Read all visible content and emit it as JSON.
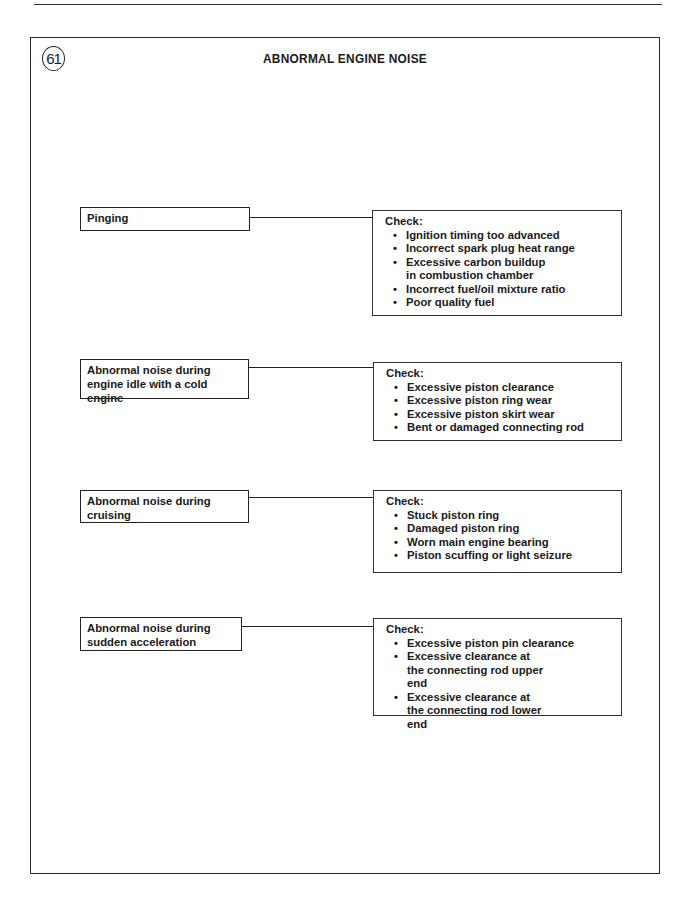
{
  "page": {
    "figure_number": "61",
    "title": "ABNORMAL ENGINE NOISE"
  },
  "rows": [
    {
      "symptom": "Pinging",
      "check_label": "Check:",
      "checks": [
        "Ignition timing too advanced",
        "Incorrect spark plug heat range",
        "Excessive carbon buildup in combustion chamber",
        "Incorrect fuel/oil mixture ratio",
        "Poor quality fuel"
      ]
    },
    {
      "symptom": "Abnormal noise during engine idle with a cold engine",
      "check_label": "Check:",
      "checks": [
        "Excessive piston clearance",
        "Excessive piston ring wear",
        "Excessive piston skirt wear",
        "Bent or damaged connecting rod"
      ]
    },
    {
      "symptom": "Abnormal noise during cruising",
      "check_label": "Check:",
      "checks": [
        "Stuck piston ring",
        "Damaged piston ring",
        "Worn main engine bearing",
        "Piston scuffing or light seizure"
      ]
    },
    {
      "symptom": "Abnormal noise during sudden acceleration",
      "check_label": "Check:",
      "checks": [
        "Excessive piston pin clearance",
        "Excessive clearance at the connecting rod upper end",
        "Excessive clearance at the connecting rod lower end"
      ]
    }
  ]
}
